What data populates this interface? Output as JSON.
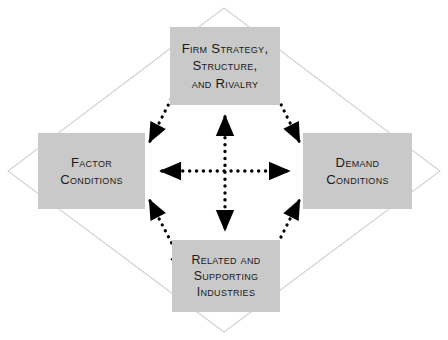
{
  "diagram": {
    "type": "diamond-framework",
    "canvas": {
      "width": 448,
      "height": 340,
      "background": "#ffffff"
    },
    "colors": {
      "box_fill": "#c9c9c9",
      "box_text": "#1a1a1a",
      "diamond_outline": "#d4d4d4",
      "arrow": "#000000",
      "background": "#ffffff"
    },
    "nodes": [
      {
        "id": "firm-strategy",
        "label": "Firm Strategy,\nStructure,\nand Rivalry",
        "position": "top"
      },
      {
        "id": "factor-conditions",
        "label": "Factor\nConditions",
        "position": "left"
      },
      {
        "id": "demand-conditions",
        "label": "Demand\nConditions",
        "position": "right"
      },
      {
        "id": "related-supporting",
        "label": "Related and\nSupporting\nIndustries",
        "position": "bottom"
      }
    ],
    "connectors": [
      {
        "id": "connector-top-left",
        "from": "firm-strategy",
        "to": "factor-conditions",
        "style": "dotted",
        "heads": "both"
      },
      {
        "id": "connector-top-right",
        "from": "firm-strategy",
        "to": "demand-conditions",
        "style": "dotted",
        "heads": "both"
      },
      {
        "id": "connector-bottom-left",
        "from": "factor-conditions",
        "to": "related-supporting",
        "style": "dotted",
        "heads": "both"
      },
      {
        "id": "connector-bottom-right",
        "from": "demand-conditions",
        "to": "related-supporting",
        "style": "dotted",
        "heads": "both"
      },
      {
        "id": "connector-horizontal",
        "from": "factor-conditions",
        "to": "demand-conditions",
        "style": "dotted",
        "heads": "both"
      },
      {
        "id": "connector-vertical",
        "from": "firm-strategy",
        "to": "related-supporting",
        "style": "dotted",
        "heads": "both"
      }
    ],
    "diamond_outline": {
      "id": "diamond-outline",
      "points": "224,8 440,171 224,332 8,171"
    }
  }
}
